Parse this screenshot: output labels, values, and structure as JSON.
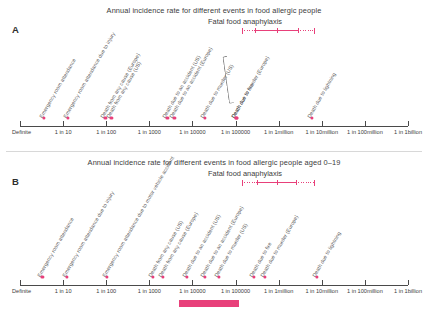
{
  "figure": {
    "background": "#ffffff",
    "accent_color": "#e8407a",
    "axis_color": "#4a4a4a",
    "label_color": "#585858"
  },
  "axis": {
    "ticks": [
      {
        "label": "Definite",
        "value": 0
      },
      {
        "label": "1 in 10",
        "value": 1
      },
      {
        "label": "1 in 100",
        "value": 2
      },
      {
        "label": "1 in 1000",
        "value": 3
      },
      {
        "label": "1 in 10000",
        "value": 4
      },
      {
        "label": "1 in 100000",
        "value": 5
      },
      {
        "label": "1 in 1million",
        "value": 6
      },
      {
        "label": "1 in 10million",
        "value": 7
      },
      {
        "label": "1 in 100million",
        "value": 8
      },
      {
        "label": "1 in 1billion",
        "value": 9
      }
    ]
  },
  "chart_data": {
    "type": "scatter",
    "title": "Annual incidence rate for different events in food allergic people",
    "xlabel": "Annual incidence rate (log scale)",
    "ylabel": "",
    "xlim": [
      0,
      9
    ],
    "grid": false,
    "legend": "none",
    "xtick_labels": [
      "Definite",
      "1 in 10",
      "1 in 100",
      "1 in 1000",
      "1 in 10000",
      "1 in 100000",
      "1 in 1million",
      "1 in 10million",
      "1 in 100million",
      "1 in 1billion"
    ],
    "panels": [
      {
        "letter": "A",
        "title": "Annual incidence rate for different events in food allergic people",
        "subtitle": "Fatal food anaphylaxis",
        "anaphylaxis_range": {
          "dotted_start": 5.15,
          "solid_start": 5.45,
          "solid_end": 6.45,
          "dotted_end": 6.85,
          "midpoint": 5.95
        },
        "points": [
          {
            "label": "Emergency room attendance",
            "value": 0.55
          },
          {
            "label": "Emergency room attendance due to injury",
            "value": 1.12
          },
          {
            "label": "Death from any cause (Europe)",
            "value": 1.98
          },
          {
            "label": "Death from any cause (US)",
            "value": 2.12
          },
          {
            "label": "Death due to an accident (US)",
            "value": 3.42
          },
          {
            "label": "Death due to an accident (Europe)",
            "value": 3.58
          },
          {
            "label": "Death due to murder (US)",
            "value": 4.28
          },
          {
            "label": "Death due to fire",
            "value": 5.02
          },
          {
            "label": "Death due to murder (Europe)",
            "value": 5.02
          },
          {
            "label": "Death due to lightning",
            "value": 6.78
          }
        ]
      },
      {
        "letter": "B",
        "title": "Annual incidence rate for different events in food allergic people aged 0–19",
        "subtitle": "Fatal food anaphylaxis",
        "anaphylaxis_range": {
          "dotted_start": 5.15,
          "solid_start": 5.5,
          "solid_end": 6.4,
          "dotted_end": 6.85,
          "midpoint": 5.95
        },
        "points": [
          {
            "label": "Emergency room attendance",
            "value": 0.52
          },
          {
            "label": "Emergency room attendance due to injury",
            "value": 1.08
          },
          {
            "label": "Emergency room attendance due to motor vehicle accident",
            "value": 2.02
          },
          {
            "label": "Death from any cause (US)",
            "value": 3.08
          },
          {
            "label": "Death from any cause (Europe)",
            "value": 3.32
          },
          {
            "label": "Death due to an accident (US)",
            "value": 3.88
          },
          {
            "label": "Death due to an accident (Europe)",
            "value": 4.28
          },
          {
            "label": "Death due to murder (US)",
            "value": 4.62
          },
          {
            "label": "Death due to fire",
            "value": 5.42
          },
          {
            "label": "Death due to murder (Europe)",
            "value": 5.68
          },
          {
            "label": "Death due to lightning",
            "value": 6.88
          }
        ]
      }
    ]
  }
}
